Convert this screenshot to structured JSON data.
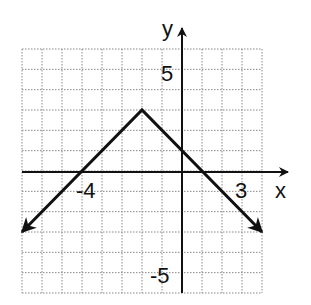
{
  "chart_data": {
    "type": "line",
    "title": "",
    "xlabel": "x",
    "ylabel": "y",
    "xlim": [
      -8,
      4
    ],
    "ylim": [
      -6,
      6
    ],
    "grid": true,
    "grid_style": "dotted",
    "tick_labels": {
      "x": [
        {
          "value": -4,
          "label": "-4"
        },
        {
          "value": 3,
          "label": "3"
        }
      ],
      "y": [
        {
          "value": 5,
          "label": "5"
        },
        {
          "value": -5,
          "label": "-5"
        }
      ]
    },
    "series": [
      {
        "name": "y = -|x + 2| + 3",
        "points": [
          [
            -8,
            -3
          ],
          [
            -2,
            3
          ],
          [
            4,
            -3
          ]
        ],
        "arrows_at_ends": true,
        "vertex": [
          -2,
          3
        ]
      }
    ],
    "colors": {
      "line": "#111111",
      "grid": "#888888",
      "axis": "#111111"
    }
  },
  "labels": {
    "x_axis": "x",
    "y_axis": "y",
    "x_tick_neg4": "-4",
    "x_tick_3": "3",
    "y_tick_5": "5",
    "y_tick_neg5": "-5"
  }
}
